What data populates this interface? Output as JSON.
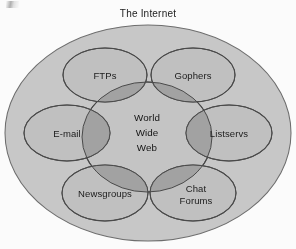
{
  "figure": {
    "title": "The Internet",
    "center": {
      "lines": [
        "World",
        "Wide",
        "Web"
      ],
      "line1": "World",
      "line2": "Wide",
      "line3": "Web"
    },
    "satellites": [
      {
        "id": "ftps",
        "label": "FTPs",
        "position": "top-left"
      },
      {
        "id": "gophers",
        "label": "Gophers",
        "position": "top-right"
      },
      {
        "id": "email",
        "label": "E-mail",
        "position": "left"
      },
      {
        "id": "listservs",
        "label": "Listservs",
        "position": "right"
      },
      {
        "id": "newsgroups",
        "label": "Newsgroups",
        "position": "bottom-left"
      },
      {
        "id": "chatforums",
        "label": "Chat Forums",
        "position": "bottom-right",
        "line1": "Chat",
        "line2": "Forums"
      }
    ],
    "colors": {
      "page_background": "#fdfdfd",
      "outer_fill": "#c9c9c9",
      "satellite_fill": "#c2c2c2",
      "center_fill": "#c6c6c6",
      "overlap_fill": "#a3a3a3",
      "outline": "#4a4a4a",
      "text": "#1b1b1b"
    }
  }
}
